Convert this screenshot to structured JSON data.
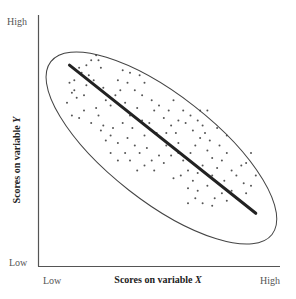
{
  "chart_data": {
    "type": "scatter",
    "title": "",
    "xlabel": "Scores on variable X",
    "ylabel": "Scores on variable Y",
    "x_ticks": [
      "Low",
      "High"
    ],
    "y_ticks": [
      "Low",
      "High"
    ],
    "xlim": [
      0,
      100
    ],
    "ylim": [
      0,
      100
    ],
    "grid": false,
    "legend": null,
    "annotations": [
      "Ellipse enclosing all points",
      "Negative-slope regression line"
    ],
    "regression_line": {
      "x": [
        13,
        90
      ],
      "y": [
        80,
        21
      ]
    },
    "ellipse": {
      "center": [
        51,
        47
      ],
      "angle_deg": -38,
      "semi_major": 58,
      "semi_minor": 22
    },
    "correlation": "negative",
    "points": [
      [
        15,
        74
      ],
      [
        17,
        79
      ],
      [
        18,
        77
      ],
      [
        15,
        70
      ],
      [
        14,
        69
      ],
      [
        12,
        65
      ],
      [
        13,
        73
      ],
      [
        16,
        67
      ],
      [
        20,
        72
      ],
      [
        19,
        68
      ],
      [
        21,
        76
      ],
      [
        22,
        82
      ],
      [
        20,
        80
      ],
      [
        24,
        84
      ],
      [
        25,
        82
      ],
      [
        26,
        79
      ],
      [
        23,
        74
      ],
      [
        27,
        71
      ],
      [
        28,
        66
      ],
      [
        24,
        63
      ],
      [
        19,
        62
      ],
      [
        17,
        59
      ],
      [
        14,
        60
      ],
      [
        22,
        57
      ],
      [
        25,
        60
      ],
      [
        27,
        56
      ],
      [
        30,
        64
      ],
      [
        32,
        68
      ],
      [
        33,
        74
      ],
      [
        35,
        78
      ],
      [
        38,
        77
      ],
      [
        37,
        73
      ],
      [
        34,
        70
      ],
      [
        36,
        65
      ],
      [
        40,
        70
      ],
      [
        42,
        76
      ],
      [
        44,
        73
      ],
      [
        43,
        68
      ],
      [
        41,
        63
      ],
      [
        38,
        60
      ],
      [
        35,
        57
      ],
      [
        31,
        55
      ],
      [
        30,
        52
      ],
      [
        33,
        49
      ],
      [
        37,
        51
      ],
      [
        40,
        48
      ],
      [
        36,
        45
      ],
      [
        33,
        42
      ],
      [
        38,
        42
      ],
      [
        42,
        45
      ],
      [
        44,
        52
      ],
      [
        46,
        57
      ],
      [
        48,
        62
      ],
      [
        47,
        66
      ],
      [
        50,
        64
      ],
      [
        52,
        59
      ],
      [
        54,
        62
      ],
      [
        56,
        66
      ],
      [
        55,
        56
      ],
      [
        57,
        53
      ],
      [
        58,
        49
      ],
      [
        53,
        48
      ],
      [
        50,
        44
      ],
      [
        47,
        42
      ],
      [
        44,
        40
      ],
      [
        41,
        38
      ],
      [
        48,
        38
      ],
      [
        52,
        41
      ],
      [
        55,
        44
      ],
      [
        58,
        45
      ],
      [
        60,
        42
      ],
      [
        62,
        38
      ],
      [
        59,
        36
      ],
      [
        56,
        35
      ],
      [
        63,
        45
      ],
      [
        65,
        48
      ],
      [
        67,
        51
      ],
      [
        64,
        54
      ],
      [
        61,
        57
      ],
      [
        58,
        58
      ],
      [
        66,
        58
      ],
      [
        68,
        56
      ],
      [
        69,
        53
      ],
      [
        71,
        50
      ],
      [
        70,
        46
      ],
      [
        72,
        43
      ],
      [
        68,
        40
      ],
      [
        66,
        37
      ],
      [
        64,
        34
      ],
      [
        62,
        31
      ],
      [
        66,
        30
      ],
      [
        70,
        32
      ],
      [
        72,
        36
      ],
      [
        74,
        39
      ],
      [
        76,
        42
      ],
      [
        78,
        45
      ],
      [
        75,
        48
      ],
      [
        77,
        34
      ],
      [
        80,
        38
      ],
      [
        82,
        36
      ],
      [
        84,
        40
      ],
      [
        86,
        41
      ],
      [
        85,
        33
      ],
      [
        80,
        30
      ],
      [
        76,
        29
      ],
      [
        73,
        27
      ],
      [
        78,
        26
      ],
      [
        82,
        27
      ],
      [
        86,
        29
      ],
      [
        88,
        32
      ],
      [
        90,
        36
      ],
      [
        72,
        24
      ],
      [
        68,
        25
      ],
      [
        65,
        27
      ],
      [
        62,
        25
      ],
      [
        88,
        45
      ],
      [
        30,
        45
      ],
      [
        28,
        50
      ],
      [
        45,
        47
      ],
      [
        49,
        53
      ],
      [
        53,
        53
      ],
      [
        39,
        55
      ],
      [
        43,
        58
      ],
      [
        26,
        54
      ],
      [
        60,
        62
      ],
      [
        63,
        60
      ],
      [
        67,
        62
      ],
      [
        70,
        62
      ],
      [
        74,
        55
      ],
      [
        78,
        52
      ]
    ]
  },
  "labels": {
    "y_high": "High",
    "y_low": "Low",
    "x_low": "Low",
    "x_high": "High",
    "x_title_prefix": "Scores on variable ",
    "x_title_var": "X",
    "y_title_prefix": "Scores on variable ",
    "y_title_var": "Y"
  },
  "colors": {
    "axis": "#555555",
    "ellipse": "#444444",
    "line": "#222222",
    "dots": "#555555"
  }
}
